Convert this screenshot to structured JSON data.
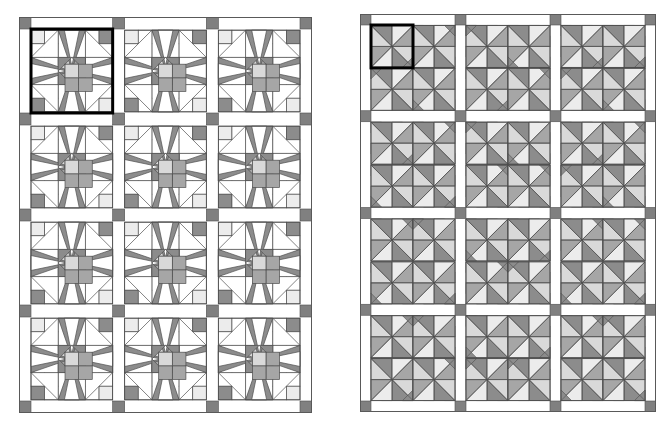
{
  "figure": {
    "background_color": "#ffffff",
    "panel_count": 2
  },
  "palette": {
    "background": "#ffffff",
    "sashing": "#ffffff",
    "cornerstone": "#808080",
    "dark_gray": "#8c8c8c",
    "medium_gray": "#a6a6a6",
    "light_gray": "#d9d9d9",
    "pale_gray": "#ececec",
    "white": "#ffffff",
    "outline": "#4d4d4d",
    "highlight_outline": "#000000",
    "border": "#595959"
  },
  "panels": [
    {
      "id": "left-quilt",
      "name": "eight-pointed-star-quilt",
      "x": 19,
      "y": 17,
      "width": 293,
      "height": 396,
      "block_columns": 3,
      "block_rows": 4,
      "block_count": 12,
      "block_style": "eight-pointed-star",
      "patch_grid": 6,
      "sashing_width": 12,
      "cornerstone_size": 12,
      "highlighted_block": {
        "row": 0,
        "column": 0,
        "outline_width": 3
      },
      "colors_used": [
        "#8c8c8c",
        "#a6a6a6",
        "#d9d9d9",
        "#ececec",
        "#ffffff"
      ]
    },
    {
      "id": "right-quilt",
      "name": "pinwheel-quilt",
      "x": 360,
      "y": 14,
      "width": 296,
      "height": 398,
      "block_columns": 3,
      "block_rows": 4,
      "blocks_per_cell": 4,
      "sub_columns": 2,
      "sub_rows": 2,
      "block_count": 48,
      "block_style": "pinwheel-triangle",
      "sashing_width": 11,
      "cornerstone_size": 11,
      "highlighted_block": {
        "row": 0,
        "column": 0,
        "sub_row": 0,
        "sub_column": 0,
        "outline_width": 3
      },
      "colors_used": [
        "#8c8c8c",
        "#a6a6a6",
        "#d9d9d9",
        "#ececec",
        "#ffffff"
      ]
    }
  ]
}
